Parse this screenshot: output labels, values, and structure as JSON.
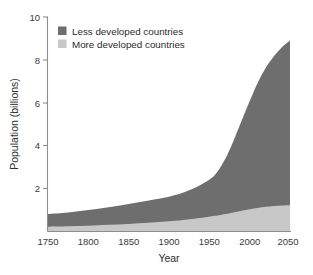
{
  "chart_data": {
    "type": "area",
    "stacked": true,
    "title": "",
    "subtitle": "",
    "xlabel": "Year",
    "ylabel": "Population (billions)",
    "xlim": [
      1750,
      2050
    ],
    "ylim": [
      0,
      10
    ],
    "xticks": [
      1750,
      1800,
      1850,
      1900,
      1950,
      2000,
      2050
    ],
    "xticklabels": [
      "1750",
      "1800",
      "1850",
      "1900",
      "1950",
      "2000",
      "2050"
    ],
    "yticks": [
      2,
      4,
      6,
      8,
      10
    ],
    "yticklabels": [
      "2",
      "4",
      "6",
      "8",
      "10"
    ],
    "grid": false,
    "legend_position": "upper-left-inside",
    "x": [
      1750,
      1775,
      1800,
      1825,
      1850,
      1875,
      1900,
      1925,
      1950,
      1960,
      1970,
      1975,
      1980,
      1990,
      2000,
      2010,
      2020,
      2030,
      2040,
      2050
    ],
    "series": [
      {
        "name": "More developed countries",
        "color": "#c8c8c8",
        "values": [
          0.2,
          0.22,
          0.25,
          0.29,
          0.33,
          0.38,
          0.45,
          0.55,
          0.67,
          0.72,
          0.79,
          0.83,
          0.87,
          0.95,
          1.02,
          1.08,
          1.13,
          1.17,
          1.19,
          1.2
        ]
      },
      {
        "name": "Less developed countries",
        "color": "#6e6e6e",
        "values": [
          0.6,
          0.65,
          0.73,
          0.82,
          0.93,
          1.05,
          1.15,
          1.35,
          1.73,
          2.05,
          2.6,
          2.95,
          3.35,
          4.2,
          5.05,
          5.85,
          6.5,
          7.0,
          7.4,
          7.7
        ]
      }
    ],
    "totals": [
      0.8,
      0.87,
      0.98,
      1.11,
      1.26,
      1.43,
      1.6,
      1.9,
      2.4,
      2.77,
      3.39,
      3.78,
      4.22,
      5.15,
      6.07,
      6.93,
      7.63,
      8.17,
      8.59,
      8.9
    ]
  },
  "legend": {
    "items": [
      {
        "label": "Less developed countries",
        "color": "#6e6e6e"
      },
      {
        "label": "More developed countries",
        "color": "#c8c8c8"
      }
    ]
  },
  "axes": {
    "y_title": "Population (billions)",
    "x_title": "Year",
    "y_tick_0": "10",
    "y_tick_1": "8",
    "y_tick_2": "6",
    "y_tick_3": "4",
    "y_tick_4": "2",
    "x_tick_0": "1750",
    "x_tick_1": "1800",
    "x_tick_2": "1850",
    "x_tick_3": "1900",
    "x_tick_4": "1950",
    "x_tick_5": "2000",
    "x_tick_6": "2050"
  }
}
